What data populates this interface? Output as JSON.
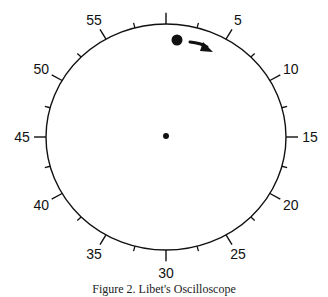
{
  "diagram": {
    "type": "clock-dial",
    "center": {
      "x": 166,
      "y": 137
    },
    "radius_x": 120,
    "radius_y": 113,
    "colors": {
      "line": "#111111",
      "background": "#ffffff"
    },
    "major_ticks": [
      {
        "value": 0,
        "label": ""
      },
      {
        "value": 5,
        "label": "5"
      },
      {
        "value": 10,
        "label": "10"
      },
      {
        "value": 15,
        "label": "15"
      },
      {
        "value": 20,
        "label": "20"
      },
      {
        "value": 25,
        "label": "25"
      },
      {
        "value": 30,
        "label": "30"
      },
      {
        "value": 35,
        "label": "35"
      },
      {
        "value": 40,
        "label": "40"
      },
      {
        "value": 45,
        "label": "45"
      },
      {
        "value": 50,
        "label": "50"
      },
      {
        "value": 55,
        "label": "55"
      }
    ],
    "minor_tick_values": [
      2.5,
      7.5,
      12.5,
      17.5,
      22.5,
      27.5,
      32.5,
      37.5,
      42.5,
      47.5,
      52.5,
      57.5
    ],
    "center_dot": {
      "x": 166,
      "y": 136,
      "r": 3
    },
    "moving_dot": {
      "x": 177,
      "y": 40,
      "r": 5.5
    },
    "arrow": {
      "direction": "clockwise"
    }
  },
  "caption": {
    "text": "Figure 2.  Libet's Oscilloscope"
  }
}
